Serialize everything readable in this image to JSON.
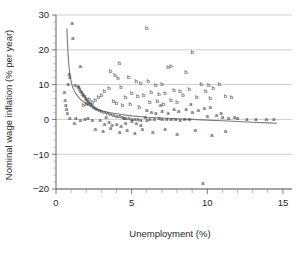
{
  "chart_data": {
    "type": "scatter",
    "title": "",
    "xlabel": "Unemployment (%)",
    "ylabel": "Nominal wage inflation (% per year)",
    "xlim": [
      0,
      15.6
    ],
    "ylim": [
      -20,
      30
    ],
    "xticks": [
      0,
      5,
      10,
      15
    ],
    "xticklabels": [
      "0",
      "5",
      "10",
      "15"
    ],
    "yticks": [
      -20,
      -10,
      0,
      10,
      20,
      30
    ],
    "yticklabels": [
      "−20",
      "−10",
      "0",
      "10",
      "20",
      "30"
    ],
    "grid": true,
    "grid_axis": "y",
    "legend": "none",
    "marker_labels": [
      "a",
      "b"
    ],
    "series": [
      {
        "name": "a",
        "marker": "a",
        "points": [
          [
            1.05,
            27.6
          ],
          [
            1.1,
            23.3
          ],
          [
            1.6,
            15.3
          ],
          [
            0.85,
            12.9
          ],
          [
            0.9,
            12.2
          ],
          [
            0.8,
            10.0
          ],
          [
            1.25,
            9.9
          ],
          [
            1.45,
            9.6
          ],
          [
            1.5,
            9.1
          ],
          [
            1.55,
            8.6
          ],
          [
            1.62,
            8.2
          ],
          [
            1.7,
            7.8
          ],
          [
            1.75,
            7.3
          ],
          [
            1.8,
            6.9
          ],
          [
            1.9,
            6.5
          ],
          [
            1.95,
            6.1
          ],
          [
            2.0,
            5.7
          ],
          [
            2.05,
            5.3
          ],
          [
            2.15,
            5.0
          ],
          [
            2.2,
            4.6
          ],
          [
            2.3,
            4.2
          ],
          [
            2.4,
            3.9
          ],
          [
            2.5,
            3.6
          ],
          [
            2.6,
            3.3
          ],
          [
            2.7,
            3.0
          ],
          [
            2.85,
            2.7
          ],
          [
            3.0,
            2.4
          ],
          [
            3.2,
            2.1
          ],
          [
            3.4,
            1.8
          ],
          [
            3.6,
            1.5
          ],
          [
            3.8,
            1.2
          ],
          [
            4.0,
            1.0
          ],
          [
            4.2,
            0.8
          ],
          [
            4.4,
            0.6
          ],
          [
            4.6,
            0.4
          ],
          [
            4.8,
            0.2
          ],
          [
            5.0,
            0.1
          ],
          [
            5.2,
            0.0
          ],
          [
            5.4,
            -0.1
          ],
          [
            5.6,
            -0.2
          ],
          [
            0.55,
            7.8
          ],
          [
            0.6,
            5.6
          ],
          [
            0.65,
            4.1
          ],
          [
            0.7,
            2.9
          ],
          [
            0.75,
            1.6
          ],
          [
            0.9,
            0.3
          ],
          [
            1.3,
            0.2
          ],
          [
            1.9,
            0.1
          ],
          [
            2.4,
            -0.4
          ],
          [
            2.9,
            -0.3
          ],
          [
            3.2,
            -1.4
          ],
          [
            3.5,
            -0.9
          ],
          [
            3.7,
            -1.7
          ],
          [
            4.0,
            -1.3
          ],
          [
            4.3,
            -2.1
          ],
          [
            4.6,
            -1.0
          ],
          [
            5.0,
            -0.6
          ],
          [
            5.3,
            -1.2
          ],
          [
            5.6,
            -1.8
          ],
          [
            6.0,
            -0.4
          ],
          [
            6.2,
            0.0
          ],
          [
            6.5,
            0.1
          ],
          [
            6.8,
            0.2
          ],
          [
            7.0,
            0.0
          ],
          [
            7.3,
            -0.1
          ],
          [
            7.6,
            0.1
          ],
          [
            7.9,
            0.0
          ],
          [
            8.2,
            -0.2
          ],
          [
            8.5,
            0.0
          ],
          [
            8.8,
            0.1
          ],
          [
            6.0,
            2.5
          ],
          [
            6.3,
            2.0
          ],
          [
            6.6,
            1.8
          ],
          [
            7.0,
            2.2
          ],
          [
            7.4,
            1.6
          ],
          [
            7.8,
            3.0
          ],
          [
            8.1,
            2.4
          ],
          [
            8.6,
            2.9
          ],
          [
            9.0,
            1.9
          ],
          [
            9.4,
            2.6
          ],
          [
            9.8,
            3.3
          ],
          [
            10.2,
            3.4
          ],
          [
            10.6,
            1.2
          ],
          [
            11.0,
            0.6
          ],
          [
            11.4,
            0.4
          ],
          [
            12.0,
            0.2
          ],
          [
            12.6,
            0.0
          ],
          [
            13.2,
            0.1
          ],
          [
            13.9,
            -0.1
          ],
          [
            14.4,
            -0.1
          ],
          [
            2.6,
            -3.0
          ],
          [
            3.1,
            -3.3
          ],
          [
            3.6,
            -2.6
          ],
          [
            4.2,
            -3.8
          ],
          [
            4.7,
            -3.2
          ],
          [
            5.2,
            -4.0
          ],
          [
            5.7,
            -2.9
          ],
          [
            6.4,
            -3.6
          ],
          [
            7.2,
            -2.8
          ],
          [
            8.0,
            -4.4
          ],
          [
            9.2,
            -3.1
          ],
          [
            10.3,
            -4.6
          ],
          [
            11.2,
            -3.5
          ],
          [
            9.7,
            -18.3
          ],
          [
            1.2,
            -1.0
          ],
          [
            1.6,
            -0.3
          ],
          [
            2.1,
            0.4
          ],
          [
            3.3,
            0.5
          ],
          [
            4.5,
            0.3
          ],
          [
            5.9,
            0.6
          ],
          [
            6.9,
            4.0
          ],
          [
            8.9,
            4.2
          ],
          [
            10.0,
            0.9
          ],
          [
            10.9,
            1.6
          ],
          [
            11.8,
            0.5
          ]
        ]
      },
      {
        "name": "b",
        "marker": "b",
        "points": [
          [
            6.0,
            26.2
          ],
          [
            9.0,
            19.2
          ],
          [
            4.2,
            16.0
          ],
          [
            7.4,
            14.9
          ],
          [
            7.6,
            15.2
          ],
          [
            8.6,
            13.6
          ],
          [
            3.6,
            13.9
          ],
          [
            3.9,
            12.8
          ],
          [
            4.1,
            11.9
          ],
          [
            4.8,
            12.2
          ],
          [
            5.3,
            11.0
          ],
          [
            5.6,
            10.4
          ],
          [
            6.1,
            10.8
          ],
          [
            6.6,
            9.8
          ],
          [
            7.0,
            10.1
          ],
          [
            9.6,
            10.0
          ],
          [
            10.1,
            9.9
          ],
          [
            10.8,
            10.1
          ],
          [
            10.4,
            8.8
          ],
          [
            9.9,
            8.2
          ],
          [
            8.8,
            8.6
          ],
          [
            8.2,
            8.0
          ],
          [
            7.8,
            8.4
          ],
          [
            7.2,
            7.6
          ],
          [
            6.8,
            7.2
          ],
          [
            6.3,
            7.8
          ],
          [
            5.8,
            7.0
          ],
          [
            5.4,
            6.6
          ],
          [
            5.0,
            7.4
          ],
          [
            4.6,
            6.2
          ],
          [
            4.3,
            9.3
          ],
          [
            3.5,
            9.0
          ],
          [
            3.2,
            8.1
          ],
          [
            3.0,
            7.0
          ],
          [
            2.8,
            6.2
          ],
          [
            2.6,
            5.4
          ],
          [
            2.4,
            4.8
          ],
          [
            2.2,
            5.9
          ],
          [
            2.0,
            4.3
          ],
          [
            1.8,
            3.9
          ],
          [
            3.8,
            5.2
          ],
          [
            4.0,
            4.6
          ],
          [
            4.4,
            4.0
          ],
          [
            4.9,
            4.4
          ],
          [
            5.5,
            3.6
          ],
          [
            6.2,
            4.8
          ],
          [
            6.7,
            5.2
          ],
          [
            7.1,
            4.2
          ],
          [
            7.6,
            5.6
          ],
          [
            8.0,
            5.0
          ],
          [
            8.4,
            6.8
          ],
          [
            9.3,
            6.4
          ],
          [
            10.2,
            6.0
          ],
          [
            11.2,
            6.6
          ],
          [
            11.6,
            6.2
          ]
        ]
      }
    ],
    "fit_curve": {
      "style": "line",
      "color": "#7a7a7a",
      "points": [
        [
          0.72,
          26.2
        ],
        [
          0.78,
          20.0
        ],
        [
          0.85,
          15.4
        ],
        [
          0.95,
          11.8
        ],
        [
          1.1,
          9.2
        ],
        [
          1.3,
          7.4
        ],
        [
          1.6,
          5.8
        ],
        [
          2.0,
          4.4
        ],
        [
          2.5,
          3.3
        ],
        [
          3.0,
          2.5
        ],
        [
          3.6,
          1.9
        ],
        [
          4.3,
          1.4
        ],
        [
          5.0,
          1.0
        ],
        [
          6.0,
          0.6
        ],
        [
          7.0,
          0.4
        ],
        [
          8.0,
          0.2
        ],
        [
          9.0,
          0.0
        ],
        [
          10.0,
          -0.2
        ],
        [
          11.0,
          -0.4
        ],
        [
          12.0,
          -0.6
        ],
        [
          13.0,
          -0.8
        ],
        [
          14.0,
          -1.0
        ],
        [
          14.6,
          -1.1
        ]
      ]
    }
  }
}
